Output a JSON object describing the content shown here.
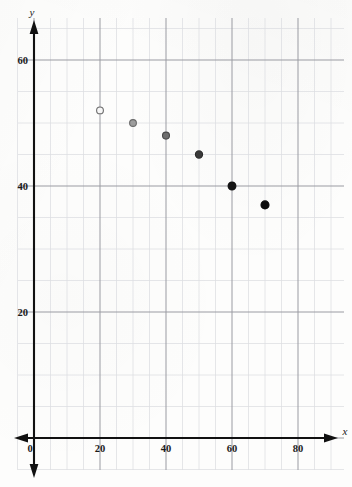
{
  "figure": {
    "background_color": "#fdfdfc",
    "grid_minor_color": "#dcdde2",
    "grid_major_color": "#9a9ba2",
    "axis_color": "#111111"
  },
  "chart_data": {
    "type": "scatter",
    "title": "",
    "subtitle": "",
    "xlabel": "x",
    "ylabel": "y",
    "xlim": [
      0,
      92
    ],
    "ylim": [
      0,
      66
    ],
    "x_ticks": [
      0,
      20,
      40,
      60,
      80
    ],
    "x_tick_labels": [
      "0",
      "20",
      "40",
      "60",
      "80"
    ],
    "y_ticks": [
      20,
      40,
      60
    ],
    "y_tick_labels": [
      "20",
      "40",
      "60"
    ],
    "grid": true,
    "grid_minor_step_x": 5,
    "grid_minor_step_y": 5,
    "legend": "none",
    "series": [
      {
        "name": "data",
        "points": [
          {
            "x": 20,
            "y": 52,
            "style": "open",
            "fill": "#f7f7f7",
            "stroke": "#6b6b6b",
            "radius": 3.4
          },
          {
            "x": 30,
            "y": 50,
            "style": "light-gray",
            "fill": "#9d9d9d",
            "stroke": "#6b6b6b",
            "radius": 3.4
          },
          {
            "x": 40,
            "y": 48,
            "style": "gray",
            "fill": "#6e6e6e",
            "stroke": "#4a4a4a",
            "radius": 3.5
          },
          {
            "x": 50,
            "y": 45,
            "style": "dark-gray",
            "fill": "#3a3a3a",
            "stroke": "#2a2a2a",
            "radius": 3.6
          },
          {
            "x": 60,
            "y": 40,
            "style": "filled",
            "fill": "#151515",
            "stroke": "#101010",
            "radius": 3.9
          },
          {
            "x": 70,
            "y": 37,
            "style": "filled",
            "fill": "#0d0d0d",
            "stroke": "#0a0a0a",
            "radius": 4.0
          }
        ]
      }
    ]
  },
  "axes": {
    "x_axis_name": "x",
    "y_axis_name": "y",
    "origin_label": "0"
  }
}
